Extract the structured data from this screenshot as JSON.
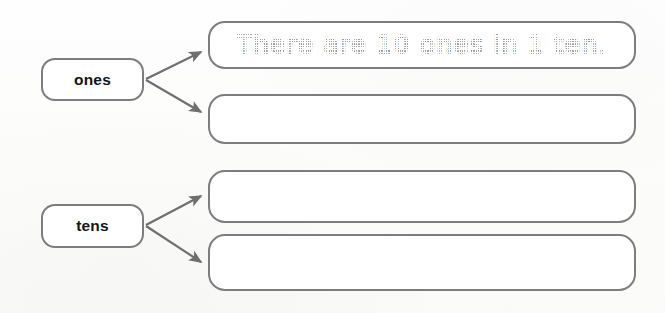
{
  "worksheet": {
    "type": "place-value-graphic-organizer",
    "background_color": "#fdfdfc",
    "line_color": "#7d7d7d",
    "arrow_color": "#6e6e6e",
    "label_text_color": "#141414",
    "traced_text_color": "#9a9a9a"
  },
  "labels": [
    {
      "id": "ones",
      "text": "ones"
    },
    {
      "id": "tens",
      "text": "tens"
    }
  ],
  "answers": [
    {
      "id": "answer-1",
      "parent": "ones",
      "text": "There are 10 ones in 1 ten.",
      "filled": true,
      "style": "traced-dotted"
    },
    {
      "id": "answer-2",
      "parent": "ones",
      "text": "",
      "filled": false,
      "style": "blank"
    },
    {
      "id": "answer-3",
      "parent": "tens",
      "text": "",
      "filled": false,
      "style": "blank"
    },
    {
      "id": "answer-4",
      "parent": "tens",
      "text": "",
      "filled": false,
      "style": "blank"
    }
  ],
  "arrows": [
    {
      "id": "arrow-ones-1",
      "from": "ones",
      "to": "answer-1"
    },
    {
      "id": "arrow-ones-2",
      "from": "ones",
      "to": "answer-2"
    },
    {
      "id": "arrow-tens-1",
      "from": "tens",
      "to": "answer-3"
    },
    {
      "id": "arrow-tens-2",
      "from": "tens",
      "to": "answer-4"
    }
  ]
}
